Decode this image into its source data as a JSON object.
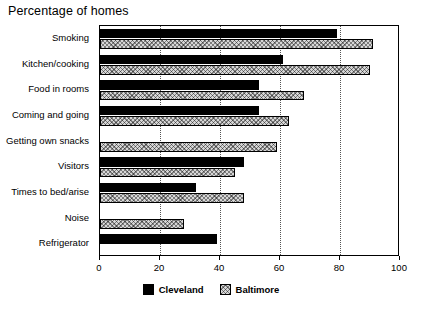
{
  "chart_data": {
    "type": "bar",
    "orientation": "horizontal",
    "title": "Percentage of homes",
    "xlabel": "",
    "ylabel": "",
    "xlim": [
      0,
      100
    ],
    "xticks": [
      0,
      20,
      40,
      60,
      80,
      100
    ],
    "xtick_labels": [
      "0",
      "20",
      "40",
      "60",
      "80",
      "100"
    ],
    "grid": "vertical-dotted",
    "legend_position": "bottom-center",
    "categories": [
      "Smoking",
      "Kitchen/cooking",
      "Food in rooms",
      "Coming and going",
      "Getting own snacks",
      "Visitors",
      "Times to bed/arise",
      "Noise",
      "Refrigerator"
    ],
    "series": [
      {
        "name": "Cleveland",
        "color": "#000000",
        "values": [
          79,
          61,
          53,
          53,
          0,
          48,
          32,
          0,
          39
        ]
      },
      {
        "name": "Baltimore",
        "color": "#d6d6d6",
        "values": [
          91,
          90,
          68,
          63,
          59,
          45,
          48,
          28,
          0
        ]
      }
    ]
  },
  "legend": {
    "items": [
      {
        "label": "Cleveland",
        "swatch": "solid-black"
      },
      {
        "label": "Baltimore",
        "swatch": "hatched-gray"
      }
    ]
  }
}
